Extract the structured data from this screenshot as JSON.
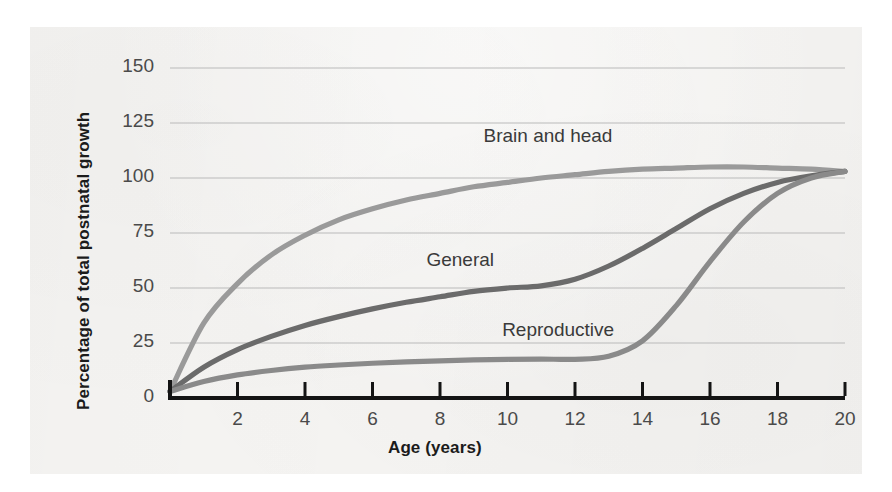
{
  "figure": {
    "background_color": "#f5f4f2",
    "page_color": "#ffffff"
  },
  "axes": {
    "y_title": "Percentage of total postnatal growth",
    "x_title": "Age (years)",
    "y_ticks": [
      "0",
      "25",
      "50",
      "75",
      "100",
      "125",
      "150"
    ],
    "x_ticks": [
      "2",
      "4",
      "6",
      "8",
      "10",
      "12",
      "14",
      "16",
      "18",
      "20"
    ],
    "axis_color": "#141414",
    "gridline_color": "#b9b9b9",
    "tick_text_color": "#4a4a4a"
  },
  "curve_labels": [
    {
      "text": "Brain and head"
    },
    {
      "text": "General"
    },
    {
      "text": "Reproductive"
    }
  ],
  "chart_data": {
    "type": "line",
    "title": "",
    "xlabel": "Age (years)",
    "ylabel": "Percentage of total postnatal growth",
    "xlim": [
      0,
      20
    ],
    "ylim": [
      0,
      158
    ],
    "xticks": [
      0,
      2,
      4,
      6,
      8,
      10,
      12,
      14,
      16,
      18,
      20
    ],
    "yticks": [
      0,
      25,
      50,
      75,
      100,
      125,
      150
    ],
    "grid": "horizontal",
    "legend": "inline-labels",
    "x": [
      0,
      1,
      2,
      3,
      4,
      5,
      6,
      7,
      8,
      9,
      10,
      11,
      12,
      13,
      14,
      15,
      16,
      17,
      18,
      19,
      20
    ],
    "series": [
      {
        "name": "Brain and head",
        "color": "#9a9a9a",
        "label_position": {
          "x": 11.2,
          "y": 118
        },
        "values": [
          3,
          34,
          52,
          65,
          74,
          81,
          86,
          90,
          93,
          96,
          98,
          100,
          101.5,
          103,
          104,
          104.5,
          105,
          105,
          104.5,
          104,
          103
        ]
      },
      {
        "name": "General",
        "color": "#6b6b6b",
        "label_position": {
          "x": 8.6,
          "y": 62
        },
        "values": [
          3,
          14,
          22,
          28,
          33,
          37,
          40.5,
          43.5,
          46,
          48.5,
          50,
          51,
          54,
          60,
          68,
          77,
          86,
          93,
          98,
          101,
          103
        ]
      },
      {
        "name": "Reproductive",
        "color": "#8a8a8a",
        "label_position": {
          "x": 11.5,
          "y": 30
        },
        "values": [
          3,
          7.5,
          10.5,
          12.5,
          14,
          15,
          15.8,
          16.4,
          16.9,
          17.3,
          17.6,
          17.7,
          17.6,
          19,
          26,
          42,
          62,
          80,
          93,
          100,
          103
        ]
      }
    ]
  }
}
